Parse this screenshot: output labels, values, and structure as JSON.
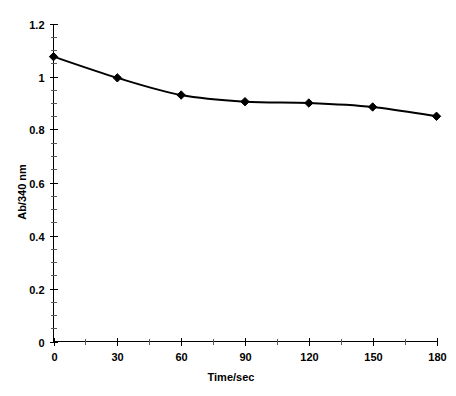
{
  "chart_data": {
    "type": "line",
    "title": "",
    "subtitle": "",
    "xlabel": "Time/sec",
    "ylabel": "Ab/340 nm",
    "x": [
      0,
      30,
      60,
      90,
      120,
      150,
      180
    ],
    "values": [
      1.075,
      0.995,
      0.93,
      0.905,
      0.9,
      0.885,
      0.85
    ],
    "series": [
      {
        "name": "Ab/340 nm",
        "values": [
          1.075,
          0.995,
          0.93,
          0.905,
          0.9,
          0.885,
          0.85
        ]
      }
    ],
    "xlim": [
      0,
      180
    ],
    "ylim": [
      0,
      1.2
    ],
    "x_tick_labels": [
      "0",
      "30",
      "60",
      "90",
      "120",
      "150",
      "180"
    ],
    "x_tick_values": [
      0,
      30,
      60,
      90,
      120,
      150,
      180
    ],
    "x_minor_tick_interval": 15,
    "y_tick_labels": [
      "0",
      "0.2",
      "0.4",
      "0.6",
      "0.8",
      "1",
      "1.2"
    ],
    "y_tick_values": [
      0,
      0.2,
      0.4,
      0.6,
      0.8,
      1,
      1.2
    ],
    "y_minor_tick_interval": 0.05,
    "grid": false,
    "legend": false,
    "legend_position": "none",
    "marker": "diamond",
    "marker_color": "#000000",
    "line_color": "#000000",
    "background_color": "#ffffff",
    "annotations": []
  }
}
